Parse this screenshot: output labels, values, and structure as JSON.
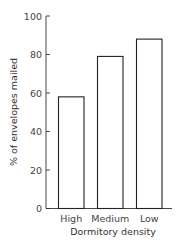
{
  "chart_data": {
    "type": "bar",
    "title": "",
    "xlabel": "Dormitory density",
    "ylabel": "% of envelopes mailed",
    "categories": [
      "High",
      "Medium",
      "Low"
    ],
    "values": [
      58,
      79,
      88
    ],
    "ylim": [
      0,
      100
    ],
    "yticks": [
      0,
      20,
      40,
      60,
      80,
      100
    ],
    "grid": false,
    "legend": null,
    "bar_fill": "#ffffff",
    "bar_stroke": "#222222"
  }
}
